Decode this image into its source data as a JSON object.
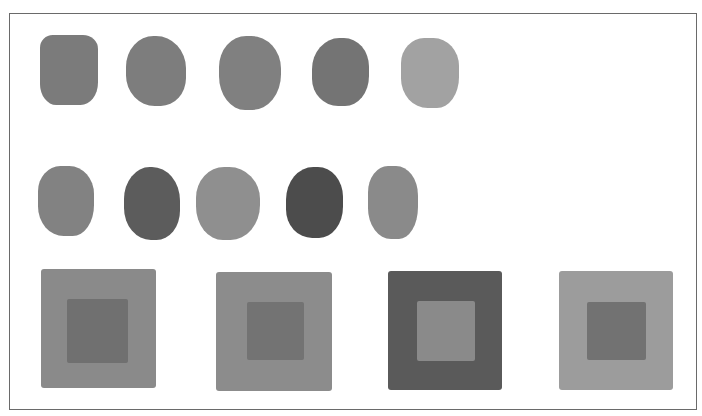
{
  "image": {
    "description": "Grayscale painted color swatches: two rows of five brush-painted blobs and a row of four concentric square color studies",
    "background": "#ffffff",
    "frame_color": "#6a6a6a"
  },
  "row1_swatches": [
    {
      "x": 40,
      "y": 35,
      "w": 58,
      "h": 70,
      "color": "#7b7b7b",
      "shape": "rounded-square"
    },
    {
      "x": 126,
      "y": 36,
      "w": 60,
      "h": 70,
      "color": "#7d7d7d",
      "shape": "blob"
    },
    {
      "x": 219,
      "y": 36,
      "w": 62,
      "h": 74,
      "color": "#808080",
      "shape": "blob"
    },
    {
      "x": 312,
      "y": 38,
      "w": 57,
      "h": 68,
      "color": "#747474",
      "shape": "blob"
    },
    {
      "x": 401,
      "y": 38,
      "w": 58,
      "h": 70,
      "color": "#a2a2a2",
      "shape": "blob"
    }
  ],
  "row2_swatches": [
    {
      "x": 38,
      "y": 166,
      "w": 56,
      "h": 70,
      "color": "#828282",
      "shape": "blob"
    },
    {
      "x": 124,
      "y": 167,
      "w": 56,
      "h": 73,
      "color": "#5c5c5c",
      "shape": "blob"
    },
    {
      "x": 196,
      "y": 167,
      "w": 64,
      "h": 73,
      "color": "#8f8f8f",
      "shape": "blob"
    },
    {
      "x": 286,
      "y": 167,
      "w": 57,
      "h": 71,
      "color": "#4c4c4c",
      "shape": "blob"
    },
    {
      "x": 368,
      "y": 166,
      "w": 50,
      "h": 73,
      "color": "#8a8a8a",
      "shape": "blob"
    }
  ],
  "squares": [
    {
      "x": 41,
      "y": 269,
      "w": 115,
      "h": 119,
      "outer": "#8a8a8a",
      "inner": {
        "x": 67,
        "y": 299,
        "w": 61,
        "h": 64,
        "color": "#707070"
      }
    },
    {
      "x": 216,
      "y": 272,
      "w": 116,
      "h": 119,
      "outer": "#8c8c8c",
      "inner": {
        "x": 247,
        "y": 302,
        "w": 57,
        "h": 58,
        "color": "#737373"
      }
    },
    {
      "x": 388,
      "y": 271,
      "w": 114,
      "h": 119,
      "outer": "#5a5a5a",
      "inner": {
        "x": 417,
        "y": 301,
        "w": 58,
        "h": 60,
        "color": "#8a8a8a"
      }
    },
    {
      "x": 559,
      "y": 271,
      "w": 114,
      "h": 119,
      "outer": "#9c9c9c",
      "inner": {
        "x": 587,
        "y": 302,
        "w": 59,
        "h": 58,
        "color": "#727272"
      }
    }
  ]
}
